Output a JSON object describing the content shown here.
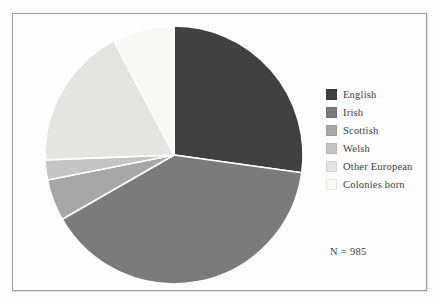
{
  "figure": {
    "background_color": "#fdfdfd",
    "frame_border_color": "#9d9d9d",
    "annotation": "N = 985"
  },
  "chart_data": {
    "type": "pie",
    "title": "",
    "labels": [
      "English",
      "Irish",
      "Scottish",
      "Welsh",
      "Other European",
      "Colonies born"
    ],
    "values_percent": [
      27.2,
      39.5,
      5.2,
      2.5,
      17.9,
      7.7
    ],
    "colors": [
      "#414141",
      "#7b7b7b",
      "#a7a7a7",
      "#c4c4c4",
      "#e4e4e2",
      "#f8f8f6"
    ],
    "start_angle_deg": 0,
    "direction": "clockwise",
    "separator_color": "#ffffff",
    "legend_position": "right",
    "annotation": "N = 985"
  }
}
